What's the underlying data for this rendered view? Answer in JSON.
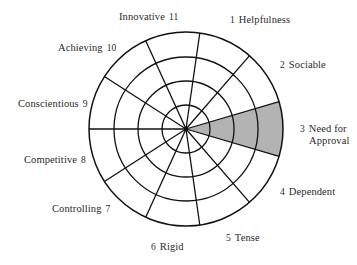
{
  "diagram": {
    "center": {
      "x": 186,
      "y": 129
    },
    "rings": [
      24,
      48,
      72,
      97
    ],
    "segment_count": 11,
    "start_angle_deg": 180,
    "line_color": "#111111",
    "shade_color": "#b3b3b3",
    "shaded_segments": [
      3
    ],
    "segments": [
      {
        "n": "1",
        "name": "Helpfulness",
        "pos": [
          226,
          14
        ],
        "num_first": true
      },
      {
        "n": "2",
        "name": "Sociable",
        "pos": [
          276,
          59
        ],
        "num_first": true
      },
      {
        "n": "3",
        "name": "Need for",
        "name2": "Approval",
        "pos": [
          296,
          123
        ],
        "num_first": true
      },
      {
        "n": "4",
        "name": "Dependent",
        "pos": [
          276,
          186
        ],
        "num_first": true
      },
      {
        "n": "5",
        "name": "Tense",
        "pos": [
          222,
          232
        ],
        "num_first": true
      },
      {
        "n": "6",
        "name": "Rigid",
        "pos": [
          147,
          241
        ],
        "num_first": true
      },
      {
        "n": "7",
        "name": "Controlling",
        "pos": [
          52,
          203
        ],
        "num_first": false
      },
      {
        "n": "8",
        "name": "Competitive",
        "pos": [
          24,
          154
        ],
        "num_first": false
      },
      {
        "n": "9",
        "name": "Conscientious",
        "pos": [
          18,
          98
        ],
        "num_first": false
      },
      {
        "n": "10",
        "name": "Achieving",
        "pos": [
          58,
          42
        ],
        "num_first": false
      },
      {
        "n": "11",
        "name": "Innovative",
        "pos": [
          119,
          11
        ],
        "num_first": false
      }
    ]
  }
}
